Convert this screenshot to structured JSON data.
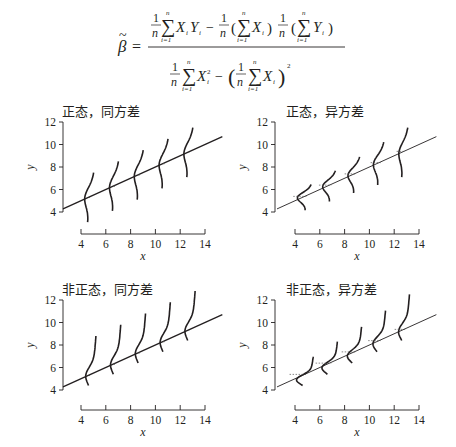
{
  "formula": {
    "lhs": "β",
    "lhs_accent": "~",
    "equals": "=",
    "one": "1",
    "n": "n",
    "sum": "∑",
    "sum_upper": "n",
    "sum_lower": "i=1",
    "minus": "−",
    "X": "X",
    "Y": "Y",
    "i": "i",
    "sq": "2",
    "lparen": "(",
    "rparen": ")"
  },
  "chart_data": [
    {
      "type": "line",
      "title": "正态，同方差",
      "xlabel": "x",
      "ylabel": "y",
      "xlim": [
        4,
        14
      ],
      "ylim": [
        4,
        12
      ],
      "xticks": [
        4,
        6,
        8,
        10,
        12,
        14
      ],
      "yticks": [
        4,
        6,
        8,
        10,
        12
      ],
      "regression_line": {
        "intercept": 3,
        "slope": 0.5,
        "x_range": [
          2.55,
          15.4
        ]
      },
      "distribution": "normal",
      "variance": "constant",
      "density_curves": [
        {
          "x": 4.6,
          "spread": 1.0
        },
        {
          "x": 6.6,
          "spread": 1.0
        },
        {
          "x": 8.6,
          "spread": 1.0
        },
        {
          "x": 10.6,
          "spread": 1.0
        },
        {
          "x": 12.6,
          "spread": 1.0
        }
      ]
    },
    {
      "type": "line",
      "title": "正态，异方差",
      "xlabel": "x",
      "ylabel": "y",
      "xlim": [
        4,
        14
      ],
      "ylim": [
        4,
        12
      ],
      "xticks": [
        4,
        6,
        8,
        10,
        12,
        14
      ],
      "yticks": [
        4,
        6,
        8,
        10,
        12
      ],
      "regression_line": {
        "intercept": 3,
        "slope": 0.5,
        "x_range": [
          2.55,
          15.4
        ]
      },
      "distribution": "normal",
      "variance": "increasing",
      "density_curves": [
        {
          "x": 4.6,
          "spread": 0.3
        },
        {
          "x": 6.6,
          "spread": 0.45
        },
        {
          "x": 8.6,
          "spread": 0.6
        },
        {
          "x": 10.6,
          "spread": 0.8
        },
        {
          "x": 12.6,
          "spread": 1.0
        }
      ]
    },
    {
      "type": "line",
      "title": "非正态，同方差",
      "xlabel": "x",
      "ylabel": "y",
      "xlim": [
        4,
        14
      ],
      "ylim": [
        4,
        12
      ],
      "xticks": [
        4,
        6,
        8,
        10,
        12,
        14
      ],
      "yticks": [
        4,
        6,
        8,
        10,
        12
      ],
      "regression_line": {
        "intercept": 3,
        "slope": 0.5,
        "x_range": [
          2.55,
          15.4
        ]
      },
      "distribution": "skewed",
      "variance": "constant",
      "density_curves": [
        {
          "x": 4.6,
          "spread": 1.0
        },
        {
          "x": 6.6,
          "spread": 1.0
        },
        {
          "x": 8.6,
          "spread": 1.0
        },
        {
          "x": 10.6,
          "spread": 1.0
        },
        {
          "x": 12.6,
          "spread": 1.0
        }
      ]
    },
    {
      "type": "line",
      "title": "非正态，异方差",
      "xlabel": "x",
      "ylabel": "y",
      "xlim": [
        4,
        14
      ],
      "ylim": [
        4,
        12
      ],
      "xticks": [
        4,
        6,
        8,
        10,
        12,
        14
      ],
      "yticks": [
        4,
        6,
        8,
        10,
        12
      ],
      "regression_line": {
        "intercept": 3,
        "slope": 0.5,
        "x_range": [
          2.55,
          15.4
        ]
      },
      "distribution": "skewed",
      "variance": "increasing",
      "density_curves": [
        {
          "x": 4.6,
          "spread": 0.3
        },
        {
          "x": 6.6,
          "spread": 0.45
        },
        {
          "x": 8.6,
          "spread": 0.6
        },
        {
          "x": 10.6,
          "spread": 0.8
        },
        {
          "x": 12.6,
          "spread": 1.0
        }
      ]
    }
  ]
}
